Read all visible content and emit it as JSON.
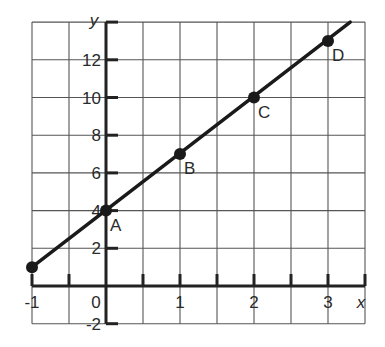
{
  "chart_data": {
    "type": "line",
    "title": "",
    "xlabel": "x",
    "ylabel": "y",
    "xlim": [
      -1,
      3.5
    ],
    "ylim": [
      -2,
      14
    ],
    "grid": true,
    "x_grid_step": 0.5,
    "y_grid_step": 2,
    "x_ticks": [
      -1,
      0,
      1,
      2,
      3
    ],
    "x_tick_labels": [
      "-1",
      "0",
      "1",
      "2",
      "3"
    ],
    "y_ticks": [
      -2,
      2,
      4,
      6,
      8,
      10,
      12
    ],
    "y_tick_labels": [
      "-2",
      "2",
      "4",
      "6",
      "8",
      "10",
      "12"
    ],
    "origin_label": "0",
    "series": [
      {
        "name": "y = 3x + 4",
        "x": [
          -1,
          0,
          1,
          2,
          3
        ],
        "y": [
          1,
          4,
          7,
          10,
          13
        ],
        "point_labels": [
          "",
          "A",
          "B",
          "C",
          "D"
        ],
        "line_extends_to": {
          "x": 3.3,
          "y": 14
        }
      }
    ],
    "colors": {
      "grid": "#555555",
      "axis": "#222222",
      "line": "#1a1a1a"
    }
  }
}
